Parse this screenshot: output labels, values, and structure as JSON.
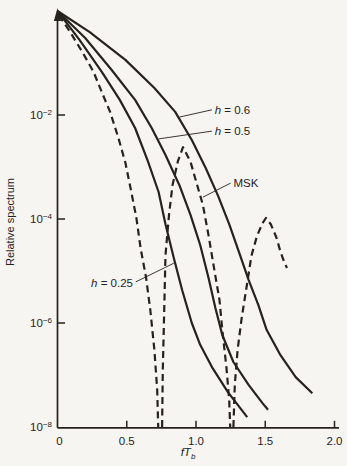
{
  "figure": {
    "kind": "scanned textbook spectrum plot",
    "ink_color": "#26231d",
    "paper_color": "#f7f5f1"
  },
  "chart_data": {
    "type": "line",
    "title": "",
    "xlabel": "fTb",
    "ylabel": "Relative spectrum",
    "x_axis": {
      "title_main": "fT",
      "title_sub": "b",
      "range": [
        0,
        2.0
      ],
      "ticks": [
        {
          "v": 0,
          "label": "0"
        },
        {
          "v": 0.5,
          "label": "0.5"
        },
        {
          "v": 1.0,
          "label": "1.0"
        },
        {
          "v": 1.5,
          "label": "1.5"
        },
        {
          "v": 2.0,
          "label": "2.0"
        }
      ]
    },
    "y_axis": {
      "title": "Relative spectrum",
      "scale": "log",
      "base": "10",
      "range_exp": [
        -8,
        0
      ],
      "tick_exponents": [
        -2,
        -4,
        -6,
        -8
      ]
    },
    "series": [
      {
        "name": "h = 0.25",
        "style": "solid",
        "segments": [
          [
            [
              0,
              0
            ],
            [
              0.16,
              -0.56
            ],
            [
              0.32,
              -1.17
            ],
            [
              0.45,
              -1.71
            ],
            [
              0.56,
              -2.25
            ],
            [
              0.65,
              -2.87
            ],
            [
              0.73,
              -3.48
            ],
            [
              0.78,
              -4.1
            ],
            [
              0.84,
              -4.75
            ],
            [
              0.9,
              -5.37
            ],
            [
              0.97,
              -6.0
            ],
            [
              1.03,
              -6.42
            ],
            [
              1.12,
              -6.87
            ],
            [
              1.23,
              -7.33
            ],
            [
              1.37,
              -7.81
            ]
          ]
        ]
      },
      {
        "name": "h = 0.5",
        "style": "solid",
        "segments": [
          [
            [
              0,
              0
            ],
            [
              0.2,
              -0.52
            ],
            [
              0.39,
              -1.13
            ],
            [
              0.56,
              -1.71
            ],
            [
              0.68,
              -2.25
            ],
            [
              0.78,
              -2.77
            ],
            [
              0.88,
              -3.35
            ],
            [
              0.96,
              -3.92
            ],
            [
              1.03,
              -4.5
            ],
            [
              1.09,
              -5.13
            ],
            [
              1.14,
              -5.71
            ],
            [
              1.19,
              -6.23
            ],
            [
              1.27,
              -6.75
            ],
            [
              1.38,
              -7.19
            ],
            [
              1.48,
              -7.54
            ],
            [
              1.52,
              -7.67
            ]
          ]
        ]
      },
      {
        "name": "h = 0.6",
        "style": "solid",
        "segments": [
          [
            [
              0,
              0
            ],
            [
              0.23,
              -0.4
            ],
            [
              0.49,
              -0.94
            ],
            [
              0.7,
              -1.48
            ],
            [
              0.85,
              -1.94
            ],
            [
              0.97,
              -2.48
            ],
            [
              1.07,
              -3.02
            ],
            [
              1.16,
              -3.56
            ],
            [
              1.24,
              -4.1
            ],
            [
              1.31,
              -4.63
            ],
            [
              1.38,
              -5.17
            ],
            [
              1.45,
              -5.65
            ],
            [
              1.51,
              -6.13
            ],
            [
              1.61,
              -6.62
            ],
            [
              1.72,
              -7.04
            ],
            [
              1.84,
              -7.35
            ]
          ]
        ]
      },
      {
        "name": "MSK",
        "style": "dashed",
        "segments": [
          [
            [
              0.01,
              -0.08
            ],
            [
              0.09,
              -0.4
            ],
            [
              0.18,
              -0.79
            ],
            [
              0.26,
              -1.17
            ],
            [
              0.32,
              -1.56
            ],
            [
              0.38,
              -1.94
            ],
            [
              0.44,
              -2.44
            ],
            [
              0.49,
              -2.92
            ],
            [
              0.53,
              -3.44
            ],
            [
              0.57,
              -3.98
            ],
            [
              0.6,
              -4.56
            ],
            [
              0.64,
              -5.13
            ],
            [
              0.67,
              -5.75
            ],
            [
              0.7,
              -6.52
            ],
            [
              0.72,
              -7.29
            ],
            [
              0.727,
              -8
            ]
          ],
          [
            [
              0.755,
              -8
            ],
            [
              0.76,
              -6.9
            ],
            [
              0.77,
              -5.85
            ],
            [
              0.78,
              -4.69
            ],
            [
              0.805,
              -3.92
            ],
            [
              0.83,
              -3.35
            ],
            [
              0.87,
              -2.88
            ],
            [
              0.906,
              -2.62
            ],
            [
              0.96,
              -2.9
            ],
            [
              1.0,
              -3.27
            ],
            [
              1.05,
              -3.73
            ],
            [
              1.09,
              -4.31
            ],
            [
              1.13,
              -4.94
            ],
            [
              1.17,
              -5.56
            ],
            [
              1.19,
              -6.13
            ],
            [
              1.22,
              -6.87
            ],
            [
              1.24,
              -7.48
            ],
            [
              1.247,
              -8
            ]
          ],
          [
            [
              1.27,
              -8
            ],
            [
              1.28,
              -7.19
            ],
            [
              1.3,
              -6.52
            ],
            [
              1.33,
              -5.9
            ],
            [
              1.37,
              -5.23
            ],
            [
              1.4,
              -4.71
            ],
            [
              1.44,
              -4.33
            ],
            [
              1.48,
              -4.08
            ],
            [
              1.505,
              -3.98
            ],
            [
              1.54,
              -4.1
            ],
            [
              1.58,
              -4.35
            ],
            [
              1.61,
              -4.63
            ],
            [
              1.64,
              -4.85
            ],
            [
              1.657,
              -4.94
            ]
          ]
        ]
      }
    ],
    "annotations": [
      {
        "label": "h = 0.6",
        "italic_first": true,
        "anchor": "start",
        "text_at": [
          1.135,
          -1.9
        ],
        "pointer": [
          [
            1.115,
            -1.9
          ],
          [
            0.88,
            -2.04
          ]
        ]
      },
      {
        "label": "h = 0.5",
        "italic_first": true,
        "anchor": "start",
        "text_at": [
          1.135,
          -2.31
        ],
        "pointer": [
          [
            1.115,
            -2.31
          ],
          [
            0.73,
            -2.46
          ]
        ]
      },
      {
        "label": "MSK",
        "italic_first": false,
        "anchor": "start",
        "text_at": [
          1.27,
          -3.31
        ],
        "pointer": [
          [
            1.25,
            -3.31
          ],
          [
            1.05,
            -3.58
          ]
        ]
      },
      {
        "label": "h = 0.25",
        "italic_first": true,
        "anchor": "end",
        "text_at": [
          0.545,
          -5.23
        ],
        "pointer": [
          [
            0.565,
            -5.21
          ],
          [
            0.84,
            -4.85
          ]
        ]
      }
    ],
    "layout": {
      "grid": false,
      "legend": "inline-annotations",
      "x0_px": 57.5,
      "y_top_px": 11,
      "y_bottom_px": 427.8,
      "x_end_px": 339,
      "px_per_unit_x": 138.5,
      "px_per_decade": 52,
      "curve_width": 2.2,
      "dash_pattern": "7 4.5"
    }
  }
}
